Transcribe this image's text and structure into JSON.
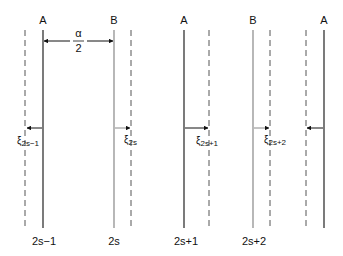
{
  "diagram": {
    "colors": {
      "solid_a": "#222222",
      "solid_b": "#888888",
      "dashed": "#555555",
      "arrow": "#111111",
      "text": "#111111",
      "background": "#ffffff"
    },
    "top_labels": [
      {
        "text": "A",
        "x": 43
      },
      {
        "text": "B",
        "x": 114
      },
      {
        "text": "A",
        "x": 184
      },
      {
        "text": "B",
        "x": 253
      },
      {
        "text": "A",
        "x": 324
      }
    ],
    "spacing_label": {
      "numerator": "α",
      "denominator": "2"
    },
    "bottom_labels": [
      {
        "text": "2s−1",
        "x": 43
      },
      {
        "text": "2s",
        "x": 114
      },
      {
        "text": "2s+1",
        "x": 186
      },
      {
        "text": "2s+2",
        "x": 254
      }
    ],
    "displacement_labels": [
      {
        "symbol": "ξ",
        "sub": "2s−1"
      },
      {
        "symbol": "ξ",
        "sub": "2s"
      },
      {
        "symbol": "ξ",
        "sub": "2s+1"
      },
      {
        "symbol": "ξ",
        "sub": "2s+2"
      }
    ]
  }
}
